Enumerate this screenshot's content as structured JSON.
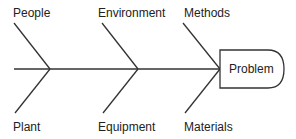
{
  "diagram": {
    "type": "fishbone",
    "problem": "Problem",
    "top_causes": [
      "People",
      "Environment",
      "Methods"
    ],
    "bottom_causes": [
      "Plant",
      "Equipment",
      "Materials"
    ],
    "line_color": "#333333"
  }
}
